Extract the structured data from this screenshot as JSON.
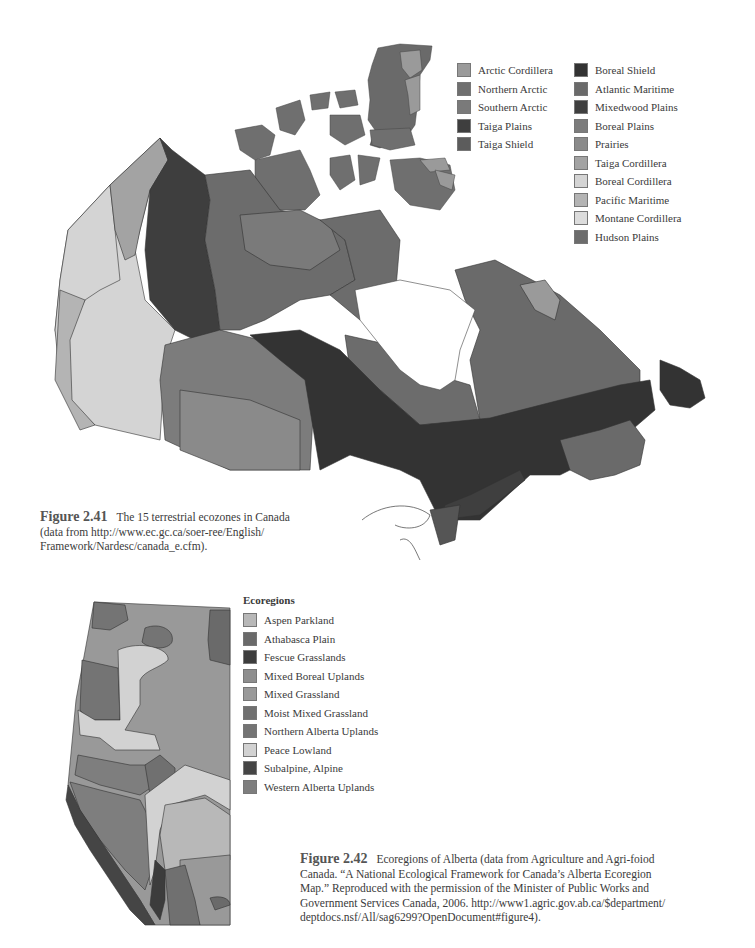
{
  "figure_241": {
    "number": "Figure 2.41",
    "caption_lines": [
      "The 15 terrestrial ecozones in Canada",
      "(data from http://www.ec.gc.ca/soer-ree/English/",
      "Framework/Nardesc/canada_e.cfm)."
    ],
    "legend": {
      "column1": [
        {
          "label": "Arctic Cordillera",
          "color": "#9a9a9a"
        },
        {
          "label": "Northern Arctic",
          "color": "#6f6f6f"
        },
        {
          "label": "Southern Arctic",
          "color": "#7a7a7a"
        },
        {
          "label": "Taiga Plains",
          "color": "#3e3e3e"
        },
        {
          "label": "Taiga Shield",
          "color": "#5c5c5c"
        }
      ],
      "column2": [
        {
          "label": "Boreal Shield",
          "color": "#333333"
        },
        {
          "label": "Atlantic Maritime",
          "color": "#6a6a6a"
        },
        {
          "label": "Mixedwood Plains",
          "color": "#3f3f3f"
        },
        {
          "label": "Boreal Plains",
          "color": "#7c7c7c"
        },
        {
          "label": "Prairies",
          "color": "#8a8a8a"
        },
        {
          "label": "Taiga Cordillera",
          "color": "#a3a3a3"
        },
        {
          "label": "Boreal Cordillera",
          "color": "#d4d4d4"
        },
        {
          "label": "Pacific Maritime",
          "color": "#b4b4b4"
        },
        {
          "label": "Montane Cordillera",
          "color": "#dcdcdc"
        },
        {
          "label": "Hudson Plains",
          "color": "#6c6c6c"
        }
      ]
    }
  },
  "figure_242": {
    "number": "Figure 2.42",
    "caption_lines": [
      "Ecoregions of Alberta (data from Agriculture and Agri-foiod",
      "Canada. “A National Ecological Framework for Canada’s Alberta Ecoregion",
      "Map.” Reproduced with the permission of the Minister of Public Works and",
      "Government Services Canada, 2006. http://www1.agric.gov.ab.ca/$department/",
      "deptdocs.nsf/All/sag6299?OpenDocument#figure4)."
    ],
    "legend": {
      "title": "Ecoregions",
      "items": [
        {
          "label": "Aspen Parkland",
          "color": "#b8b8b8"
        },
        {
          "label": "Athabasca Plain",
          "color": "#6a6a6a"
        },
        {
          "label": "Fescue Grasslands",
          "color": "#3c3c3c"
        },
        {
          "label": "Mixed Boreal Uplands",
          "color": "#8e8e8e"
        },
        {
          "label": "Mixed Grassland",
          "color": "#999999"
        },
        {
          "label": "Moist Mixed Grassland",
          "color": "#707070"
        },
        {
          "label": "Northern Alberta Uplands",
          "color": "#747474"
        },
        {
          "label": "Peace Lowland",
          "color": "#d2d2d2"
        },
        {
          "label": "Subalpine, Alpine",
          "color": "#454545"
        },
        {
          "label": "Western Alberta Uplands",
          "color": "#7e7e7e"
        }
      ]
    }
  }
}
